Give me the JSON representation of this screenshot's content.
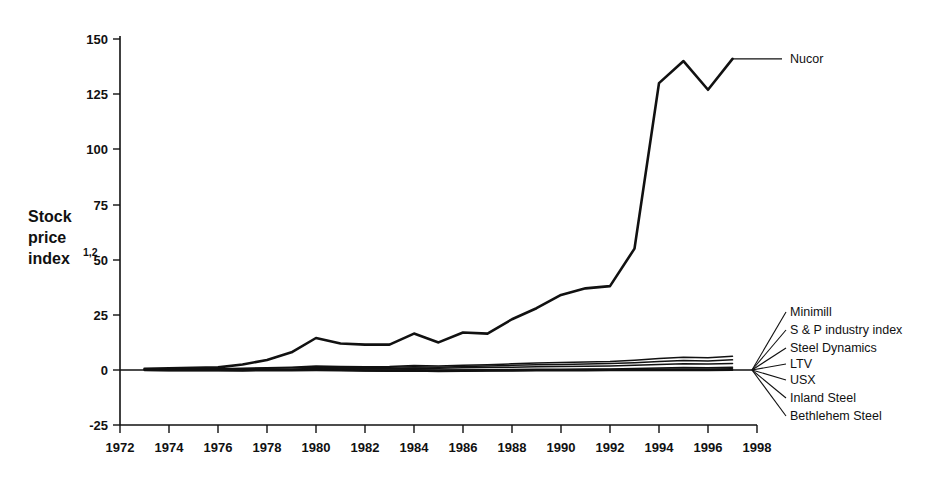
{
  "chart_data": {
    "type": "line",
    "title": "",
    "xlabel": "",
    "ylabel": "Stock price index",
    "ylabel_superscript": "1,2",
    "xlim": [
      1972,
      1998
    ],
    "ylim": [
      -25,
      150
    ],
    "grid": false,
    "legend_position": "right-inline-labels",
    "x_ticks": [
      1972,
      1974,
      1976,
      1978,
      1980,
      1982,
      1984,
      1986,
      1988,
      1990,
      1992,
      1994,
      1996,
      1998
    ],
    "y_ticks": [
      -25,
      0,
      25,
      50,
      75,
      100,
      125,
      150
    ],
    "x": [
      1973,
      1974,
      1975,
      1976,
      1977,
      1978,
      1979,
      1980,
      1981,
      1982,
      1983,
      1984,
      1985,
      1986,
      1987,
      1988,
      1989,
      1990,
      1991,
      1992,
      1993,
      1994,
      1995,
      1996,
      1997
    ],
    "series": [
      {
        "name": "Nucor",
        "values": [
          0.5,
          0.8,
          1.0,
          1.2,
          2.5,
          4.5,
          8.0,
          14.5,
          12.0,
          11.5,
          11.5,
          16.5,
          12.5,
          17.0,
          16.5,
          23.0,
          28.0,
          34.0,
          37.0,
          38.0,
          55.0,
          130.0,
          140.0,
          127.0,
          141.0
        ]
      },
      {
        "name": "Minimill",
        "values": [
          0.3,
          0.4,
          0.5,
          0.6,
          0.8,
          1.0,
          1.3,
          1.8,
          1.6,
          1.5,
          1.6,
          2.0,
          1.8,
          2.2,
          2.4,
          2.8,
          3.2,
          3.4,
          3.6,
          3.8,
          4.4,
          5.2,
          5.8,
          5.6,
          6.2
        ]
      },
      {
        "name": "S & P industry index",
        "values": [
          0.2,
          0.3,
          0.4,
          0.5,
          0.6,
          0.8,
          1.0,
          1.3,
          1.2,
          1.1,
          1.2,
          1.5,
          1.3,
          1.6,
          1.8,
          2.1,
          2.4,
          2.5,
          2.7,
          2.9,
          3.3,
          3.9,
          4.3,
          4.1,
          4.6
        ]
      },
      {
        "name": "Steel Dynamics",
        "values": [
          0.1,
          0.1,
          0.2,
          0.2,
          0.3,
          0.4,
          0.5,
          0.7,
          0.6,
          0.6,
          0.7,
          0.9,
          0.8,
          1.0,
          1.1,
          1.3,
          1.5,
          1.6,
          1.7,
          1.8,
          2.1,
          2.5,
          2.8,
          2.7,
          3.0
        ]
      },
      {
        "name": "LTV",
        "values": [
          0.0,
          0.0,
          0.0,
          0.0,
          0.0,
          0.1,
          0.1,
          0.2,
          0.1,
          0.0,
          0.0,
          0.1,
          -0.1,
          0.0,
          0.1,
          0.2,
          0.3,
          0.3,
          0.4,
          0.5,
          0.7,
          0.9,
          1.1,
          1.0,
          1.3
        ]
      },
      {
        "name": "USX",
        "values": [
          0.0,
          -0.1,
          -0.1,
          -0.1,
          -0.1,
          0.0,
          0.0,
          0.1,
          0.0,
          -0.2,
          -0.2,
          -0.1,
          -0.3,
          -0.2,
          -0.1,
          0.0,
          0.1,
          0.1,
          0.1,
          0.2,
          0.3,
          0.4,
          0.5,
          0.4,
          0.6
        ]
      },
      {
        "name": "Inland Steel",
        "values": [
          -0.1,
          -0.2,
          -0.2,
          -0.2,
          -0.2,
          -0.1,
          -0.1,
          0.0,
          -0.1,
          -0.3,
          -0.4,
          -0.3,
          -0.5,
          -0.4,
          -0.3,
          -0.2,
          -0.1,
          -0.1,
          -0.1,
          0.0,
          0.0,
          0.1,
          0.1,
          0.1,
          0.2
        ]
      },
      {
        "name": "Bethlehem Steel",
        "values": [
          -0.2,
          -0.3,
          -0.3,
          -0.3,
          -0.4,
          -0.3,
          -0.3,
          -0.2,
          -0.3,
          -0.5,
          -0.6,
          -0.5,
          -0.7,
          -0.6,
          -0.5,
          -0.4,
          -0.3,
          -0.3,
          -0.3,
          -0.2,
          -0.2,
          -0.2,
          -0.2,
          -0.2,
          -0.1
        ]
      }
    ],
    "annotations": [
      {
        "label": "Nucor",
        "anchor_year": 1997,
        "anchor_value": 141
      },
      {
        "label": "Minimill",
        "anchor_year": 1997,
        "anchor_value": 6.2
      },
      {
        "label": "S & P industry index",
        "anchor_year": 1997,
        "anchor_value": 4.6
      },
      {
        "label": "Steel Dynamics",
        "anchor_year": 1997,
        "anchor_value": 3.0
      },
      {
        "label": "LTV",
        "anchor_year": 1997,
        "anchor_value": 1.3
      },
      {
        "label": "USX",
        "anchor_year": 1997,
        "anchor_value": 0.6
      },
      {
        "label": "Inland Steel",
        "anchor_year": 1997,
        "anchor_value": 0.2
      },
      {
        "label": "Bethlehem Steel",
        "anchor_year": 1997,
        "anchor_value": -0.1
      }
    ],
    "colors": {
      "line": "#111111",
      "background": "#ffffff",
      "axis": "#111111"
    }
  },
  "axis": {
    "y_title_line1": "Stock",
    "y_title_line2": "price",
    "y_title_line3": "index",
    "y_title_superscript": "1,2",
    "y_tick_labels": [
      "150",
      "125",
      "100",
      "75",
      "50",
      "25",
      "0",
      "-25"
    ],
    "x_tick_labels": [
      "1972",
      "1974",
      "1976",
      "1978",
      "1980",
      "1982",
      "1984",
      "1986",
      "1988",
      "1990",
      "1992",
      "1994",
      "1996",
      "1998"
    ]
  },
  "legend": {
    "nucor": "Nucor",
    "items": [
      "Minimill",
      "S & P industry index",
      "Steel Dynamics",
      "LTV",
      "USX",
      "Inland Steel",
      "Bethlehem Steel"
    ]
  }
}
